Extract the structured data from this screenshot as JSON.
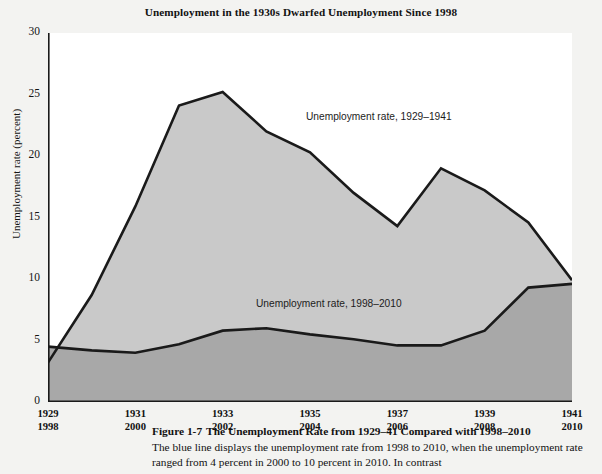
{
  "chart_title": "Unemployment in the 1930s Dwarfed Unemployment Since 1998",
  "axes": {
    "ylabel": "Unemployment rate (percent)",
    "y_ticks": [
      "30",
      "25",
      "20",
      "15",
      "10",
      "5",
      "0"
    ],
    "x_ticks_top": [
      "1929",
      "1931",
      "1933",
      "1935",
      "1937",
      "1939",
      "1941"
    ],
    "x_ticks_bottom": [
      "1998",
      "2000",
      "2002",
      "2004",
      "2006",
      "2008",
      "2010"
    ]
  },
  "annotations": {
    "upper": "Unemployment rate, 1929–1941",
    "lower": "Unemployment rate, 1998–2010"
  },
  "caption": {
    "figure_number": "Figure 1-7",
    "headline": "The Unemployment Rate from 1929–41 Compared with 1998–2010",
    "body": "The blue line displays the unemployment rate from 1998 to 2010, when the unemployment rate ranged from 4 percent in 2000 to 10 percent in 2010. In contrast"
  },
  "colors": {
    "upper_fill": "#c9c9c9",
    "lower_fill": "#a8a8a8",
    "line": "#1a1a1a",
    "page_bg": "#f3f3f1",
    "plot_bg": "#ffffff"
  },
  "chart_data": {
    "type": "area",
    "title": "Unemployment in the 1930s Dwarfed Unemployment Since 1998",
    "xlabel": "",
    "ylabel": "Unemployment rate (percent)",
    "ylim": [
      0,
      30
    ],
    "grid": false,
    "legend": "inline-annotations",
    "x_axis_1": [
      1929,
      1930,
      1931,
      1932,
      1933,
      1934,
      1935,
      1936,
      1937,
      1938,
      1939,
      1940,
      1941
    ],
    "x_axis_2": [
      1998,
      1999,
      2000,
      2001,
      2002,
      2003,
      2004,
      2005,
      2006,
      2007,
      2008,
      2009,
      2010
    ],
    "series": [
      {
        "name": "Unemployment rate, 1929–1941",
        "x": [
          1929,
          1930,
          1931,
          1932,
          1933,
          1934,
          1935,
          1936,
          1937,
          1938,
          1939,
          1940,
          1941
        ],
        "values": [
          3.2,
          8.7,
          15.9,
          24.1,
          25.2,
          22.0,
          20.3,
          17.0,
          14.3,
          19.0,
          17.2,
          14.6,
          9.9
        ]
      },
      {
        "name": "Unemployment rate, 1998–2010",
        "x": [
          1998,
          1999,
          2000,
          2001,
          2002,
          2003,
          2004,
          2005,
          2006,
          2007,
          2008,
          2009,
          2010
        ],
        "values": [
          4.5,
          4.2,
          4.0,
          4.7,
          5.8,
          6.0,
          5.5,
          5.1,
          4.6,
          4.6,
          5.8,
          9.3,
          9.6
        ]
      }
    ]
  }
}
